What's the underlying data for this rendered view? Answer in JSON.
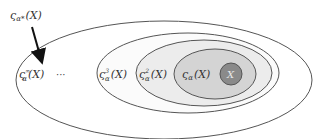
{
  "diagram": {
    "type": "nested-sets",
    "pointer_label": {
      "base": "ς",
      "sub": "α*",
      "arg": "(X)"
    },
    "sets": [
      {
        "id": "inf",
        "base": "ς",
        "sub": "α",
        "sup": "∞",
        "arg": "(X)",
        "fill": "#ffffff",
        "stroke": "#555555"
      },
      {
        "id": "ellipsis",
        "text": "···"
      },
      {
        "id": "cube",
        "base": "ς",
        "sub": "α",
        "sup": "3",
        "arg": "(X)",
        "fill": "#fbfbfb",
        "stroke": "#555555"
      },
      {
        "id": "square",
        "base": "ς",
        "sub": "α",
        "sup": "2",
        "arg": "(X)",
        "fill": "#ececec",
        "stroke": "#555555"
      },
      {
        "id": "single",
        "base": "ς",
        "sub": "α",
        "sup": "",
        "arg": "(X)",
        "fill": "#d4d4d4",
        "stroke": "#555555"
      },
      {
        "id": "X",
        "text": "X",
        "fill": "#8a8a8a",
        "stroke": "#555555"
      }
    ]
  }
}
